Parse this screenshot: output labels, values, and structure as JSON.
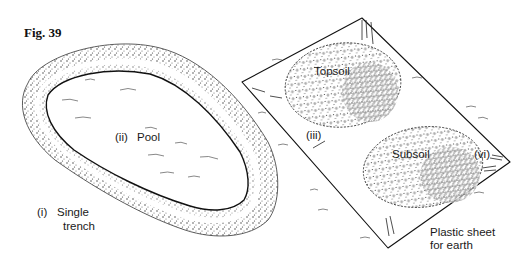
{
  "figure": {
    "title": "Fig. 39"
  },
  "labels": {
    "trench_num": "(i)",
    "trench_line1": "Single",
    "trench_line2": "trench",
    "pool_num": "(ii)",
    "pool": "Pool",
    "topsoil_num": "(iii)",
    "topsoil": "Topsoil",
    "subsoil": "Subsoil",
    "subsoil_num": "(vi)",
    "sheet_line1": "Plastic sheet",
    "sheet_line2": "for earth"
  },
  "colors": {
    "ink": "#1a1a1a",
    "background": "#ffffff"
  }
}
